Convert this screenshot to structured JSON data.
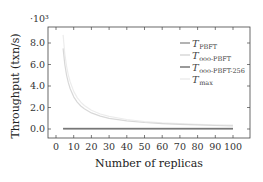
{
  "chart_data": {
    "type": "line",
    "title": "",
    "xlabel": "Number of replicas",
    "ylabel": "Throughput (txn/s)",
    "y_scale_label": "·10³",
    "xlim": [
      -2,
      108
    ],
    "ylim": [
      -0.8,
      9.6
    ],
    "x_ticks": [
      0,
      10,
      20,
      30,
      40,
      50,
      60,
      70,
      80,
      90,
      100
    ],
    "x_tick_labels": [
      "0",
      "10",
      "20",
      "30",
      "40",
      "50",
      "60",
      "70",
      "80",
      "90",
      "100"
    ],
    "y_ticks": [
      0,
      2,
      4,
      6,
      8
    ],
    "y_tick_labels": [
      "0.0",
      "2.0",
      "4.0",
      "6.0",
      "8.0"
    ],
    "grid": false,
    "legend_position": "upper right",
    "x": [
      4,
      5,
      6,
      7,
      8,
      10,
      12,
      14,
      16,
      20,
      25,
      30,
      40,
      50,
      60,
      70,
      80,
      90,
      100
    ],
    "series": [
      {
        "name": "T_PBFT",
        "label_main": "T",
        "label_sub": "PBFT",
        "color": "#9a9a9a",
        "width": 1.4,
        "values": [
          0.05,
          0.05,
          0.05,
          0.05,
          0.05,
          0.05,
          0.05,
          0.05,
          0.05,
          0.05,
          0.05,
          0.05,
          0.05,
          0.05,
          0.05,
          0.05,
          0.05,
          0.05,
          0.05
        ]
      },
      {
        "name": "T_ooo-PBFT",
        "label_main": "T",
        "label_sub": "ooo-PBFT",
        "color": "#d8d8d8",
        "width": 1.2,
        "values": [
          7.5,
          6.0,
          5.0,
          4.29,
          3.75,
          3.0,
          2.5,
          2.14,
          1.88,
          1.5,
          1.2,
          1.0,
          0.75,
          0.6,
          0.5,
          0.43,
          0.38,
          0.33,
          0.3
        ]
      },
      {
        "name": "T_ooo-PBFT-256",
        "label_main": "T",
        "label_sub": "ooo-PBFT-256",
        "color": "#777777",
        "width": 1.4,
        "values": [
          0.03,
          0.03,
          0.03,
          0.03,
          0.03,
          0.03,
          0.03,
          0.03,
          0.03,
          0.03,
          0.03,
          0.03,
          0.03,
          0.03,
          0.03,
          0.03,
          0.03,
          0.03,
          0.03
        ]
      },
      {
        "name": "T_max",
        "label_main": "T",
        "label_sub": "max",
        "color": "#ececec",
        "width": 1.2,
        "values": [
          8.75,
          7.0,
          5.83,
          5.0,
          4.38,
          3.5,
          2.92,
          2.5,
          2.19,
          1.75,
          1.4,
          1.17,
          0.88,
          0.7,
          0.58,
          0.5,
          0.44,
          0.39,
          0.35
        ]
      }
    ]
  }
}
